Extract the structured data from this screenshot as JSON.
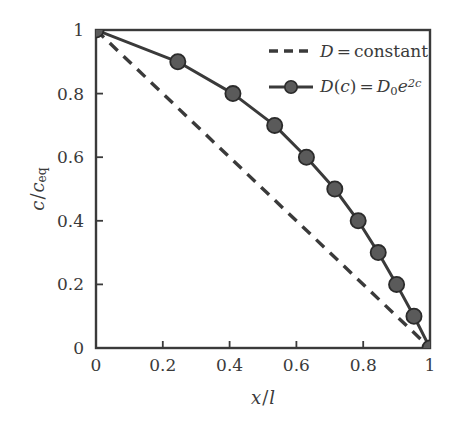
{
  "figure": {
    "width": 461,
    "height": 427,
    "background": "#ffffff",
    "line_color": "#3a3a3a",
    "marker_face_color": "#5a5a5a",
    "marker_edge_color": "#2b2b2b",
    "axis_color": "#3a3a3a"
  },
  "axes": {
    "x_label": "x/l",
    "x_label_parts": {
      "numerator": "x",
      "slash": "/",
      "denominator": "l"
    },
    "y_label": "c/c_eq",
    "y_label_parts": {
      "numerator": "c",
      "slash": "/",
      "denominator": "c",
      "subscript": "eq"
    },
    "x_ticks": [
      "0",
      "0.2",
      "0.4",
      "0.6",
      "0.8",
      "1"
    ],
    "y_ticks": [
      "0",
      "0.2",
      "0.4",
      "0.6",
      "0.8",
      "1"
    ],
    "x_tick_values": [
      0,
      0.2,
      0.4,
      0.6,
      0.8,
      1
    ],
    "y_tick_values": [
      0,
      0.2,
      0.4,
      0.6,
      0.8,
      1
    ],
    "xlim": [
      0,
      1
    ],
    "ylim": [
      0,
      1
    ],
    "tick_direction": "in",
    "grid": false,
    "box": true
  },
  "legend": {
    "position": "upper-right",
    "frame": false,
    "entries": [
      {
        "id": "legend-entry-constant",
        "style": "dashed",
        "marker": false,
        "label": "D = constant",
        "label_parts": {
          "symbol": "D",
          "eq": "=",
          "value": "constant"
        }
      },
      {
        "id": "legend-entry-exponential",
        "style": "solid",
        "marker": true,
        "label": "D(c) = D_0 e^{2c}",
        "label_parts": {
          "symbol": "D",
          "arg_open": "(",
          "arg": "c",
          "arg_close": ")",
          "eq": "=",
          "base": "D",
          "base_sub": "0",
          "exp_base": "e",
          "exp_sup": "2c"
        }
      }
    ]
  },
  "chart_data": {
    "type": "line",
    "title": "",
    "xlabel": "x/l",
    "ylabel": "c/c_eq",
    "xlim": [
      0,
      1
    ],
    "ylim": [
      0,
      1
    ],
    "grid": false,
    "legend_position": "upper right",
    "series": [
      {
        "name": "D = constant",
        "style": "dashed",
        "marker": "none",
        "color": "#3a3a3a",
        "x": [
          0,
          1
        ],
        "y": [
          1,
          0
        ]
      },
      {
        "name": "D(c) = D_0 e^{2c}",
        "style": "solid",
        "marker": "circle",
        "color": "#3a3a3a",
        "x": [
          0,
          0.245,
          0.41,
          0.535,
          0.63,
          0.715,
          0.785,
          0.845,
          0.9,
          0.952,
          1
        ],
        "y": [
          1,
          0.9,
          0.8,
          0.7,
          0.6,
          0.5,
          0.4,
          0.3,
          0.2,
          0.1,
          0
        ]
      }
    ]
  }
}
